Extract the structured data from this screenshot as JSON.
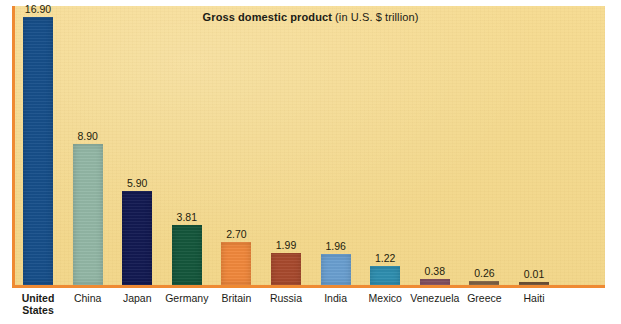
{
  "chart_data": {
    "type": "bar",
    "title": "Gross domestic product (in U.S. $ trillion)",
    "title_main": "Gross domestic product",
    "title_sub": " (in U.S. $ trillion)",
    "xlabel": "",
    "ylabel": "",
    "ylim": [
      0,
      17.6
    ],
    "grid": false,
    "legend": "none",
    "units": "U.S. $ trillion",
    "categories": [
      "United States",
      "China",
      "Japan",
      "Germany",
      "Britain",
      "Russia",
      "India",
      "Mexico",
      "Venezuela",
      "Greece",
      "Haiti"
    ],
    "values": [
      16.9,
      8.9,
      5.9,
      3.81,
      2.7,
      1.99,
      1.96,
      1.22,
      0.38,
      0.26,
      0.01
    ],
    "value_labels": [
      "16.90",
      "8.90",
      "5.90",
      "3.81",
      "2.70",
      "1.99",
      "1.96",
      "1.22",
      "0.38",
      "0.26",
      "0.01"
    ],
    "bar_colors": [
      "#174f8a",
      "#93b7a6",
      "#131a52",
      "#15573c",
      "#f0883c",
      "#a84a2e",
      "#6a9fd0",
      "#2f8fb0",
      "#8a5566",
      "#8a6a4a",
      "#7a5a3c"
    ],
    "highlighted_category": "United States"
  },
  "colors": {
    "panel_background": "#f3d98f",
    "axis": "#ef8a33",
    "page_background": "#ffffff",
    "text": "#1b1b16"
  }
}
